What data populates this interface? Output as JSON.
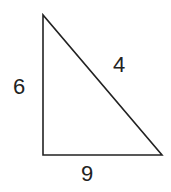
{
  "diagram": {
    "type": "right-triangle",
    "vertices": {
      "top": [
        43,
        15
      ],
      "bottom_left": [
        43,
        155
      ],
      "bottom_right": [
        162,
        155
      ]
    },
    "stroke_color": "#222222",
    "labels": {
      "left_side": "6",
      "hypotenuse": "4",
      "bottom_side": "9"
    }
  }
}
